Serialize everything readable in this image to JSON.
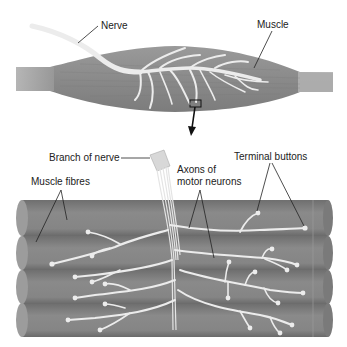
{
  "diagram": {
    "colors": {
      "muscle": "#8c8c8c",
      "muscle_dark": "#6e6e6e",
      "tendon": "#b4b4b4",
      "nerve": "#ececec",
      "label_text": "#222222",
      "background": "#ffffff"
    },
    "labels": {
      "nerve": "Nerve",
      "muscle": "Muscle",
      "branch_of_nerve": "Branch of nerve",
      "terminal_buttons": "Terminal buttons",
      "axons_line1": "Axons of",
      "axons_line2": "motor neurons",
      "muscle_fibres": "Muscle fibres"
    },
    "parts": [
      {
        "id": "muscle",
        "desc": "Whole spindle-shaped muscle with branching nerve"
      },
      {
        "id": "zoom-box",
        "desc": "Small rectangle marking the magnified region"
      },
      {
        "id": "zoom-arrow",
        "desc": "Arrow pointing to the magnified view"
      },
      {
        "id": "muscle-fibres",
        "desc": "Four stacked cylindrical muscle fibres"
      },
      {
        "id": "nerve-branch",
        "desc": "Cut nerve branch splitting into axons"
      },
      {
        "id": "axons",
        "desc": "Axons branching across fibres ending in terminal buttons"
      }
    ]
  }
}
